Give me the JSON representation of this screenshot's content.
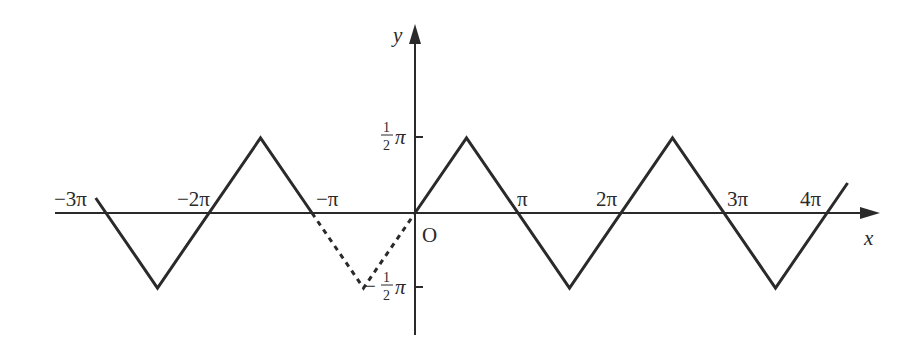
{
  "axes": {
    "x_label": "x",
    "y_label": "y",
    "origin_label": "O"
  },
  "x_ticks": [
    {
      "label": "−3π",
      "value": -3
    },
    {
      "label": "−2π",
      "value": -2
    },
    {
      "label": "−π",
      "value": -1
    },
    {
      "label": "π",
      "value": 1
    },
    {
      "label": "2π",
      "value": 2
    },
    {
      "label": "3π",
      "value": 3
    },
    {
      "label": "4π",
      "value": 4
    }
  ],
  "y_ticks": [
    {
      "num": "1",
      "den": "2",
      "sym": "π",
      "sign": "",
      "value": 0.5
    },
    {
      "num": "1",
      "den": "2",
      "sym": "π",
      "sign": "−",
      "value": -0.5
    }
  ],
  "chart_data": {
    "type": "line",
    "title": "",
    "xlabel": "x",
    "ylabel": "y",
    "x_unit": "π",
    "y_unit": "π",
    "xlim": [
      -3.1,
      4.2
    ],
    "ylim": [
      -0.5,
      0.5
    ],
    "series": [
      {
        "name": "solid-left",
        "style": "solid",
        "x": [
          -3.1,
          -2.5,
          -1.5,
          -1
        ],
        "y": [
          0.1,
          -0.5,
          0.5,
          0
        ]
      },
      {
        "name": "dashed",
        "style": "dashed",
        "x": [
          -1,
          -0.5,
          0
        ],
        "y": [
          0,
          -0.5,
          0
        ]
      },
      {
        "name": "solid-right",
        "style": "solid",
        "x": [
          0,
          0.5,
          1.5,
          2.5,
          3.5,
          4.2
        ],
        "y": [
          0,
          0.5,
          -0.5,
          0.5,
          -0.5,
          0.2
        ]
      }
    ]
  }
}
